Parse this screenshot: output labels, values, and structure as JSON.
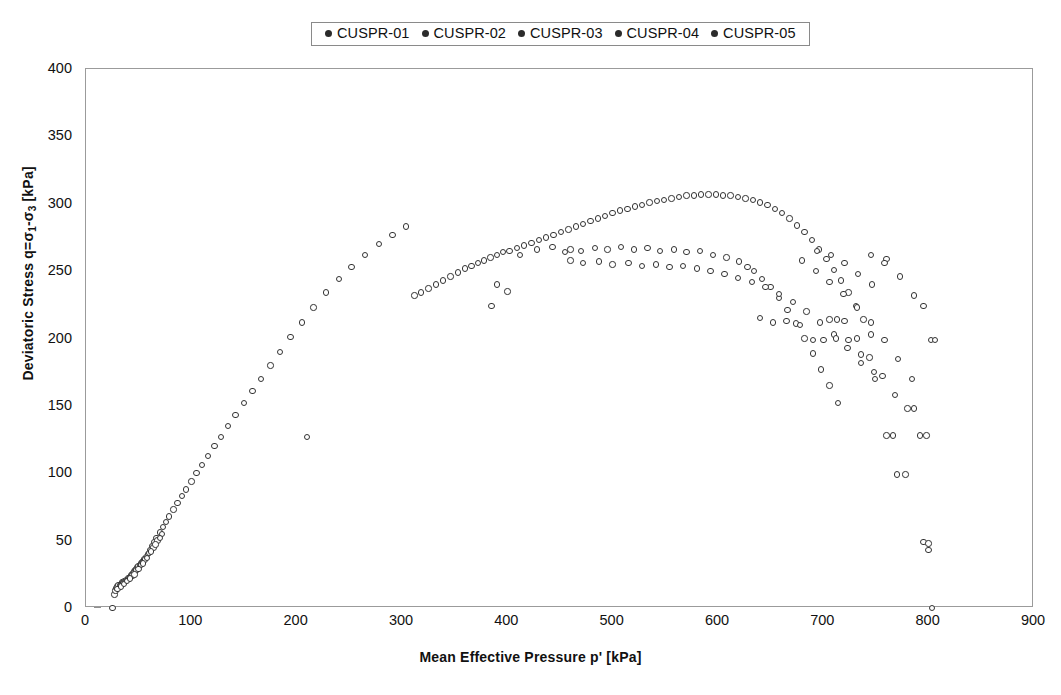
{
  "legend": {
    "position": "top-center",
    "entries": [
      {
        "label": "CUSPR-01",
        "marker": "filled-circle",
        "color": "#2b2b2b"
      },
      {
        "label": "CUSPR-02",
        "marker": "filled-circle",
        "color": "#2b2b2b"
      },
      {
        "label": "CUSPR-03",
        "marker": "filled-circle",
        "color": "#2b2b2b"
      },
      {
        "label": "CUSPR-04",
        "marker": "filled-circle",
        "color": "#2b2b2b"
      },
      {
        "label": "CUSPR-05",
        "marker": "filled-circle",
        "color": "#2b2b2b"
      }
    ]
  },
  "axes": {
    "x_title": "Mean Effective Pressure p' [kPa]",
    "y_title_html": "Deviatoric Stress q=&sigma;<sub>1</sub>-&sigma;<sub>3</sub> [kPa]",
    "x_ticks": [
      0,
      100,
      200,
      300,
      400,
      500,
      600,
      700,
      800,
      900
    ],
    "y_ticks": [
      0,
      50,
      100,
      150,
      200,
      250,
      300,
      350,
      400
    ],
    "xlim": [
      0,
      900
    ],
    "ylim": [
      0,
      400
    ],
    "grid": false,
    "frame_color": "#9b9b9b"
  },
  "chart_data": {
    "type": "scatter",
    "title": "",
    "xlabel": "Mean Effective Pressure p' [kPa]",
    "ylabel": "Deviatoric Stress q=σ1-σ3 [kPa]",
    "xlim": [
      0,
      900
    ],
    "ylim": [
      0,
      400
    ],
    "grid": false,
    "legend_position": "top-center",
    "marker": "open-circle",
    "marker_color": "#333333",
    "series": [
      {
        "name": "CUSPR-01",
        "points": [
          [
            25,
            0
          ],
          [
            27,
            10
          ],
          [
            28,
            13
          ],
          [
            29,
            15
          ],
          [
            30,
            16
          ],
          [
            31,
            17
          ],
          [
            32,
            17
          ],
          [
            33,
            18
          ],
          [
            34,
            19
          ],
          [
            35,
            19
          ],
          [
            36,
            20
          ],
          [
            37,
            20
          ],
          [
            38,
            21
          ],
          [
            39,
            21
          ],
          [
            40,
            22
          ],
          [
            41,
            22
          ],
          [
            42,
            23
          ],
          [
            43,
            24
          ],
          [
            44,
            25
          ],
          [
            45,
            26
          ],
          [
            46,
            27
          ],
          [
            47,
            28
          ],
          [
            48,
            29
          ],
          [
            49,
            30
          ],
          [
            50,
            31
          ],
          [
            51,
            32
          ],
          [
            52,
            33
          ],
          [
            53,
            34
          ],
          [
            54,
            35
          ],
          [
            55,
            36
          ],
          [
            57,
            38
          ],
          [
            59,
            40
          ],
          [
            61,
            43
          ],
          [
            63,
            46
          ],
          [
            65,
            49
          ],
          [
            67,
            52
          ],
          [
            70,
            56
          ],
          [
            73,
            60
          ],
          [
            76,
            64
          ],
          [
            79,
            68
          ],
          [
            83,
            73
          ],
          [
            87,
            78
          ],
          [
            91,
            83
          ],
          [
            95,
            88
          ],
          [
            100,
            94
          ],
          [
            105,
            100
          ],
          [
            110,
            106
          ],
          [
            116,
            113
          ],
          [
            122,
            120
          ],
          [
            128,
            127
          ],
          [
            135,
            135
          ],
          [
            142,
            143
          ],
          [
            150,
            152
          ],
          [
            158,
            161
          ],
          [
            166,
            170
          ],
          [
            175,
            180
          ],
          [
            184,
            190
          ],
          [
            194,
            201
          ],
          [
            205,
            212
          ],
          [
            216,
            223
          ],
          [
            228,
            234
          ],
          [
            240,
            244
          ],
          [
            252,
            253
          ],
          [
            265,
            262
          ],
          [
            278,
            270
          ],
          [
            291,
            277
          ],
          [
            304,
            283
          ],
          [
            312,
            232
          ],
          [
            318,
            234
          ],
          [
            325,
            237
          ],
          [
            332,
            240
          ],
          [
            339,
            243
          ],
          [
            346,
            246
          ],
          [
            353,
            249
          ],
          [
            360,
            252
          ],
          [
            366,
            254
          ],
          [
            372,
            256
          ],
          [
            378,
            258
          ],
          [
            384,
            260
          ],
          [
            390,
            262
          ],
          [
            396,
            264
          ],
          [
            402,
            265
          ],
          [
            409,
            267
          ],
          [
            416,
            269
          ],
          [
            423,
            271
          ],
          [
            430,
            273
          ],
          [
            437,
            275
          ],
          [
            444,
            277
          ],
          [
            451,
            279
          ],
          [
            458,
            281
          ],
          [
            465,
            283
          ],
          [
            472,
            285
          ],
          [
            479,
            287
          ],
          [
            486,
            289
          ],
          [
            493,
            291
          ],
          [
            500,
            293
          ],
          [
            507,
            295
          ],
          [
            514,
            296
          ],
          [
            521,
            298
          ],
          [
            528,
            299
          ],
          [
            535,
            301
          ],
          [
            542,
            302
          ],
          [
            549,
            303
          ],
          [
            556,
            304
          ],
          [
            563,
            305
          ],
          [
            570,
            306
          ],
          [
            577,
            306
          ],
          [
            584,
            307
          ],
          [
            591,
            307
          ],
          [
            598,
            307
          ],
          [
            605,
            306
          ],
          [
            612,
            306
          ],
          [
            619,
            305
          ],
          [
            626,
            304
          ],
          [
            633,
            303
          ],
          [
            640,
            301
          ],
          [
            647,
            299
          ],
          [
            654,
            296
          ],
          [
            661,
            293
          ],
          [
            668,
            289
          ],
          [
            675,
            284
          ],
          [
            682,
            279
          ],
          [
            689,
            273
          ],
          [
            696,
            266
          ],
          [
            703,
            259
          ],
          [
            710,
            251
          ],
          [
            717,
            243
          ],
          [
            724,
            234
          ],
          [
            731,
            224
          ],
          [
            738,
            214
          ],
          [
            745,
            203
          ]
        ]
      },
      {
        "name": "CUSPR-02",
        "points": [
          [
            210,
            127
          ],
          [
            385,
            224
          ],
          [
            390,
            240
          ],
          [
            400,
            235
          ],
          [
            412,
            262
          ],
          [
            428,
            266
          ],
          [
            443,
            268
          ],
          [
            455,
            264
          ],
          [
            460,
            266
          ],
          [
            470,
            265
          ],
          [
            483,
            267
          ],
          [
            495,
            266
          ],
          [
            508,
            268
          ],
          [
            520,
            266
          ],
          [
            533,
            267
          ],
          [
            545,
            265
          ],
          [
            558,
            266
          ],
          [
            570,
            264
          ],
          [
            583,
            265
          ],
          [
            595,
            262
          ],
          [
            608,
            260
          ],
          [
            620,
            257
          ],
          [
            628,
            253
          ],
          [
            634,
            250
          ],
          [
            642,
            244
          ],
          [
            650,
            238
          ],
          [
            658,
            230
          ],
          [
            666,
            221
          ],
          [
            674,
            211
          ],
          [
            682,
            200
          ],
          [
            690,
            189
          ],
          [
            698,
            177
          ],
          [
            706,
            165
          ],
          [
            714,
            152
          ]
        ]
      },
      {
        "name": "CUSPR-03",
        "points": [
          [
            44,
            24
          ],
          [
            48,
            28
          ],
          [
            52,
            32
          ],
          [
            56,
            36
          ],
          [
            60,
            41
          ],
          [
            64,
            45
          ],
          [
            68,
            50
          ],
          [
            72,
            55
          ],
          [
            460,
            258
          ],
          [
            472,
            256
          ],
          [
            487,
            257
          ],
          [
            500,
            255
          ],
          [
            515,
            256
          ],
          [
            528,
            254
          ],
          [
            541,
            255
          ],
          [
            554,
            253
          ],
          [
            567,
            254
          ],
          [
            580,
            252
          ],
          [
            593,
            250
          ],
          [
            606,
            248
          ],
          [
            619,
            245
          ],
          [
            632,
            242
          ],
          [
            645,
            238
          ],
          [
            658,
            233
          ],
          [
            671,
            227
          ],
          [
            684,
            220
          ],
          [
            697,
            212
          ],
          [
            710,
            203
          ],
          [
            723,
            193
          ],
          [
            736,
            182
          ],
          [
            749,
            170
          ],
          [
            760,
            128
          ],
          [
            766,
            128
          ],
          [
            770,
            99
          ],
          [
            778,
            99
          ],
          [
            795,
            49
          ],
          [
            800,
            48
          ],
          [
            800,
            43
          ],
          [
            803,
            0
          ]
        ]
      },
      {
        "name": "CUSPR-04",
        "points": [
          [
            640,
            215
          ],
          [
            652,
            212
          ],
          [
            665,
            213
          ],
          [
            678,
            210
          ],
          [
            690,
            199
          ],
          [
            700,
            199
          ],
          [
            712,
            200
          ],
          [
            724,
            199
          ],
          [
            736,
            188
          ],
          [
            748,
            175
          ],
          [
            706,
            214
          ],
          [
            713,
            214
          ],
          [
            720,
            213
          ],
          [
            732,
            200
          ],
          [
            744,
            186
          ],
          [
            756,
            172
          ],
          [
            768,
            158
          ],
          [
            780,
            148
          ],
          [
            786,
            148
          ],
          [
            792,
            128
          ],
          [
            798,
            128
          ]
        ]
      },
      {
        "name": "CUSPR-05",
        "points": [
          [
            30,
            14
          ],
          [
            33,
            16
          ],
          [
            36,
            18
          ],
          [
            39,
            20
          ],
          [
            42,
            22
          ],
          [
            46,
            25
          ],
          [
            50,
            29
          ],
          [
            54,
            33
          ],
          [
            58,
            37
          ],
          [
            62,
            42
          ],
          [
            66,
            47
          ],
          [
            70,
            52
          ],
          [
            680,
            258
          ],
          [
            693,
            250
          ],
          [
            706,
            242
          ],
          [
            719,
            233
          ],
          [
            732,
            223
          ],
          [
            745,
            212
          ],
          [
            758,
            199
          ],
          [
            771,
            185
          ],
          [
            784,
            170
          ],
          [
            760,
            259
          ],
          [
            773,
            246
          ],
          [
            786,
            232
          ],
          [
            795,
            224
          ],
          [
            802,
            199
          ],
          [
            806,
            199
          ],
          [
            745,
            262
          ],
          [
            758,
            256
          ],
          [
            694,
            265
          ],
          [
            707,
            262
          ],
          [
            720,
            256
          ],
          [
            733,
            248
          ],
          [
            746,
            240
          ]
        ]
      }
    ]
  }
}
